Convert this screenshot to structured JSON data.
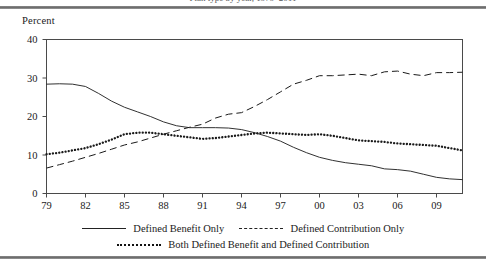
{
  "figure": {
    "truncated_title": "Plan type by year, 1979–2011",
    "y_axis_title": "Percent",
    "rule_color": "#6e6e6e"
  },
  "legend": {
    "position": "bottom",
    "entries": [
      {
        "label": "Defined Benefit Only",
        "style": "solid",
        "swatch": "line-solid-icon"
      },
      {
        "label": "Defined Contribution Only",
        "style": "dashed",
        "swatch": "line-dashed-icon"
      },
      {
        "label": "Both Defined Benefit and Defined Contribution",
        "style": "dotted",
        "swatch": "line-dotted-icon"
      }
    ]
  },
  "chart_data": {
    "type": "line",
    "title": "",
    "xlabel": "",
    "ylabel": "Percent",
    "xlim": [
      1979,
      2011
    ],
    "ylim": [
      0,
      40
    ],
    "yticks": [
      0,
      10,
      20,
      30,
      40
    ],
    "ytick_labels": [
      "0",
      "10",
      "20",
      "30",
      "40"
    ],
    "xticks": [
      1979,
      1982,
      1985,
      1988,
      1991,
      1994,
      1997,
      2000,
      2003,
      2006,
      2009
    ],
    "xtick_labels": [
      "79",
      "82",
      "85",
      "88",
      "91",
      "94",
      "97",
      "00",
      "03",
      "06",
      "09"
    ],
    "grid": false,
    "x": [
      1979,
      1980,
      1981,
      1982,
      1983,
      1984,
      1985,
      1986,
      1987,
      1988,
      1989,
      1990,
      1991,
      1992,
      1993,
      1994,
      1995,
      1996,
      1997,
      1998,
      1999,
      2000,
      2001,
      2002,
      2003,
      2004,
      2005,
      2006,
      2007,
      2008,
      2009,
      2010,
      2011
    ],
    "series": [
      {
        "name": "Defined Benefit Only",
        "style": "solid",
        "values": [
          28.4,
          28.5,
          28.4,
          27.8,
          26.0,
          24.0,
          22.4,
          21.2,
          20.0,
          18.6,
          17.6,
          17.1,
          17.1,
          17.1,
          17.0,
          16.6,
          15.8,
          14.8,
          13.6,
          12.0,
          10.6,
          9.4,
          8.6,
          8.0,
          7.6,
          7.2,
          6.4,
          6.2,
          5.8,
          5.0,
          4.2,
          3.8,
          3.6
        ]
      },
      {
        "name": "Defined Contribution Only",
        "style": "dashed",
        "values": [
          6.6,
          7.5,
          8.4,
          9.4,
          10.4,
          11.5,
          12.6,
          13.4,
          14.4,
          15.4,
          16.3,
          17.2,
          18.0,
          19.6,
          20.6,
          21.0,
          22.6,
          24.4,
          26.4,
          28.4,
          29.4,
          30.6,
          30.6,
          30.8,
          31.0,
          30.6,
          31.6,
          31.8,
          31.0,
          30.6,
          31.4,
          31.4,
          31.5
        ]
      },
      {
        "name": "Both Defined Benefit and Defined Contribution",
        "style": "dotted",
        "values": [
          10.2,
          10.6,
          11.2,
          11.8,
          12.8,
          14.0,
          15.4,
          15.8,
          15.8,
          15.4,
          15.0,
          14.6,
          14.2,
          14.4,
          14.8,
          15.2,
          15.6,
          15.8,
          15.6,
          15.4,
          15.2,
          15.4,
          15.0,
          14.4,
          13.8,
          13.6,
          13.4,
          13.0,
          12.8,
          12.6,
          12.4,
          11.8,
          11.2
        ]
      }
    ]
  }
}
